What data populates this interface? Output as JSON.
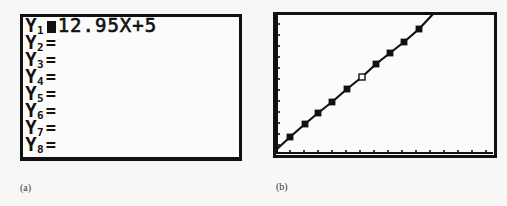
{
  "panel_a": {
    "caption": "(a)",
    "screen": "Y= editor",
    "rows": [
      {
        "var": "Y",
        "sub": "1",
        "eq": "=",
        "selected": true,
        "expr": "12.95X+5"
      },
      {
        "var": "Y",
        "sub": "2",
        "eq": "=",
        "selected": false,
        "expr": ""
      },
      {
        "var": "Y",
        "sub": "3",
        "eq": "=",
        "selected": false,
        "expr": ""
      },
      {
        "var": "Y",
        "sub": "4",
        "eq": "=",
        "selected": false,
        "expr": ""
      },
      {
        "var": "Y",
        "sub": "5",
        "eq": "=",
        "selected": false,
        "expr": ""
      },
      {
        "var": "Y",
        "sub": "6",
        "eq": "=",
        "selected": false,
        "expr": ""
      },
      {
        "var": "Y",
        "sub": "7",
        "eq": "=",
        "selected": false,
        "expr": ""
      },
      {
        "var": "Y",
        "sub": "8",
        "eq": "=",
        "selected": false,
        "expr": ""
      }
    ]
  },
  "panel_b": {
    "caption": "(b)",
    "screen": "Graph window",
    "colors": {
      "line": "#111111",
      "marker": "#111111",
      "background": "#fbfbfa"
    }
  },
  "chart_data": {
    "type": "scatter",
    "title": "",
    "xlabel": "",
    "ylabel": "",
    "grid": false,
    "axis_ticks": {
      "x_count": 15,
      "y_count": 13
    },
    "series": [
      {
        "name": "Y1 = 12.95X+5",
        "kind": "line",
        "pixels": [
          [
            277,
            149
          ],
          [
            290,
            137
          ],
          [
            305,
            124
          ],
          [
            318,
            113
          ],
          [
            332,
            102
          ],
          [
            347,
            89
          ],
          [
            362,
            77
          ],
          [
            376,
            64
          ],
          [
            390,
            53
          ],
          [
            404,
            42
          ],
          [
            419,
            29
          ],
          [
            434,
            13
          ]
        ]
      },
      {
        "name": "data points",
        "kind": "markers",
        "pixels": [
          [
            290,
            137
          ],
          [
            305,
            124
          ],
          [
            318,
            113
          ],
          [
            332,
            102
          ],
          [
            347,
            89
          ],
          [
            362,
            77
          ],
          [
            376,
            64
          ],
          [
            390,
            53
          ],
          [
            404,
            42
          ],
          [
            419,
            29
          ]
        ],
        "open_marker_index": 5
      }
    ]
  }
}
